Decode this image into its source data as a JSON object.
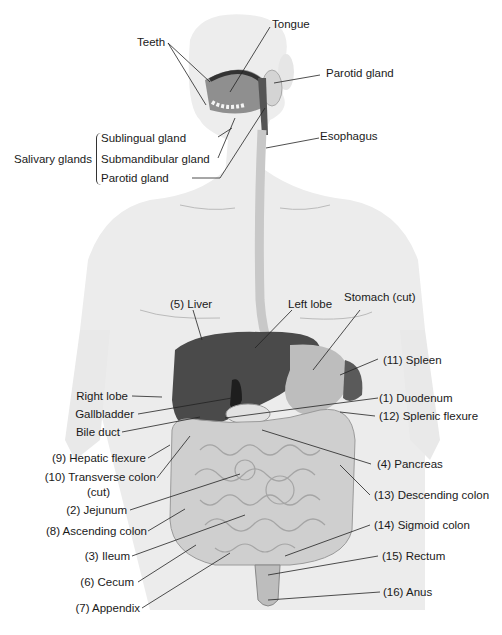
{
  "figure": {
    "head_labels": {
      "tongue": "Tongue",
      "teeth": "Teeth",
      "parotid_gland_right": "Parotid gland",
      "esophagus": "Esophagus",
      "salivary_group": "Salivary glands",
      "sublingual": "Sublingual gland",
      "submandibular": "Submandibular  gland",
      "parotid_left": "Parotid gland"
    },
    "torso_labels": {
      "liver": "(5) Liver",
      "left_lobe": "Left lobe",
      "stomach": "Stomach (cut)",
      "spleen": "(11) Spleen",
      "right_lobe": "Right lobe",
      "gallbladder": "Gallbladder",
      "bile_duct": "Bile duct",
      "duodenum": "(1) Duodenum",
      "splenic_flexure": "(12) Splenic flexure",
      "hepatic_flexure": "(9) Hepatic flexure",
      "transverse_colon": "(10) Transverse colon",
      "transverse_colon_cut": "(cut)",
      "pancreas": "(4) Pancreas",
      "jejunum": "(2) Jejunum",
      "descending_colon": "(13) Descending colon",
      "ascending_colon": "(8) Ascending colon",
      "sigmoid_colon": "(14) Sigmoid colon",
      "ileum": "(3) Ileum",
      "rectum": "(15) Rectum",
      "cecum": "(6) Cecum",
      "anus": "(16) Anus",
      "appendix": "(7) Appendix"
    },
    "colors": {
      "body": "#ececec",
      "liver": "#4a4a4a",
      "stomach": "#bdbdbd",
      "intestine": "#cfcfcf",
      "leader": "#222222"
    }
  }
}
